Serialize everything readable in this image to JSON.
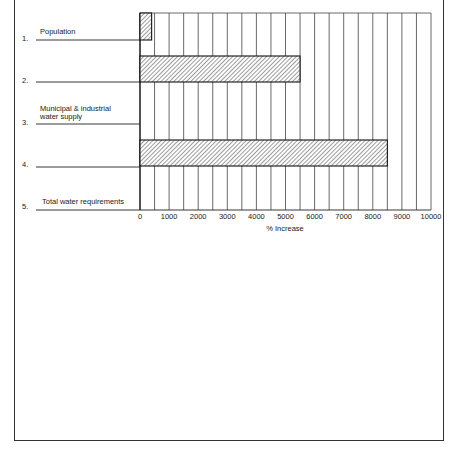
{
  "chart_data": {
    "type": "bar",
    "orientation": "horizontal",
    "title": "",
    "xlabel": "% Increase",
    "ylabel": "",
    "xlim": [
      0,
      10000
    ],
    "x_ticks": [
      "0",
      "1000",
      "2000",
      "3000",
      "4000",
      "5000",
      "6000",
      "7000",
      "8000",
      "9000",
      "10000"
    ],
    "rows": [
      {
        "number": "1.",
        "label": "Population",
        "value": 400
      },
      {
        "number": "2.",
        "label": "",
        "value": 5500
      },
      {
        "number": "3.",
        "label": "Municipal & industrial water supply",
        "label_lines": [
          "Municipal & industrial",
          "water supply"
        ],
        "value": null
      },
      {
        "number": "4.",
        "label": "",
        "value": 8500
      },
      {
        "number": "5.",
        "label": "Total water requirements",
        "value": null
      }
    ],
    "categories": [
      "Population",
      "2.",
      "Municipal & industrial water supply",
      "4.",
      "Total water requirements"
    ],
    "values": [
      400,
      5500,
      null,
      8500,
      null
    ],
    "grid": "vertical every 500",
    "bar_fill": "diagonal hatch"
  }
}
